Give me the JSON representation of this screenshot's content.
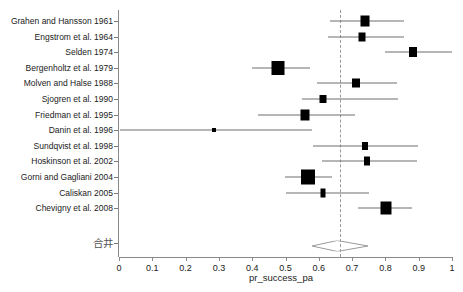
{
  "chart_data": {
    "type": "forest",
    "title": "",
    "xlabel": "pr_success_pa",
    "ylabel": "",
    "xlim": [
      0,
      1
    ],
    "xticks": [
      "0",
      "0.1",
      "0.2",
      "0.3",
      "0.4",
      "0.5",
      "0.6",
      "0.7",
      "0.8",
      "0.9",
      "1"
    ],
    "xtick_values": [
      0,
      0.1,
      0.2,
      0.3,
      0.4,
      0.5,
      0.6,
      0.7,
      0.8,
      0.9,
      1
    ],
    "grid": false,
    "legend": "none",
    "reference_line": 0.665,
    "summary_label": "合井",
    "summary": {
      "estimate": 0.665,
      "ci_low": 0.589,
      "ci_high": 0.757
    },
    "categories": [
      "Grahen and Hansson 1961",
      "Engstrom et al. 1964",
      "Selden 1974",
      "Bergenholtz et al. 1979",
      "Molven and Halse 1988",
      "Sjogren et al. 1990",
      "Friedman et al. 1995",
      "Danin et al. 1996",
      "Sundqvist et al. 1998",
      "Hoskinson et al. 2002",
      "Gorni and Gagliani 2004",
      "Caliskan 2005",
      "Chevigny et al. 2008"
    ],
    "studies": [
      {
        "label": "Grahen and Hansson 1961",
        "estimate": 0.739,
        "ci_low": 0.634,
        "ci_high": 0.856,
        "marker": "box",
        "box_w": 9,
        "box_h": 11
      },
      {
        "label": "Engstrom et al. 1964",
        "estimate": 0.73,
        "ci_low": 0.628,
        "ci_high": 0.856,
        "marker": "box",
        "box_w": 7,
        "box_h": 9
      },
      {
        "label": "Selden 1974",
        "estimate": 0.883,
        "ci_low": 0.799,
        "ci_high": 1.0,
        "marker": "box",
        "box_w": 8,
        "box_h": 10
      },
      {
        "label": "Bergenholtz et al. 1979",
        "estimate": 0.478,
        "ci_low": 0.4,
        "ci_high": 0.574,
        "marker": "box",
        "box_w": 13,
        "box_h": 14
      },
      {
        "label": "Molven and Halse 1988",
        "estimate": 0.712,
        "ci_low": 0.595,
        "ci_high": 0.835,
        "marker": "box",
        "box_w": 8,
        "box_h": 9
      },
      {
        "label": "Sjogren et al. 1990",
        "estimate": 0.613,
        "ci_low": 0.55,
        "ci_high": 0.838,
        "marker": "box",
        "box_w": 7,
        "box_h": 8
      },
      {
        "label": "Friedman et al. 1995",
        "estimate": 0.559,
        "ci_low": 0.417,
        "ci_high": 0.709,
        "marker": "box",
        "box_w": 9,
        "box_h": 11
      },
      {
        "label": "Danin et al. 1996",
        "estimate": 0.286,
        "ci_low": 0.003,
        "ci_high": 0.58,
        "marker": "dot",
        "box_w": 4,
        "box_h": 4
      },
      {
        "label": "Sundqvist et al. 1998",
        "estimate": 0.739,
        "ci_low": 0.583,
        "ci_high": 0.898,
        "marker": "box",
        "box_w": 6,
        "box_h": 8
      },
      {
        "label": "Hoskinson et al. 2002",
        "estimate": 0.745,
        "ci_low": 0.61,
        "ci_high": 0.895,
        "marker": "box",
        "box_w": 6,
        "box_h": 9
      },
      {
        "label": "Gorni and Gagliani 2004",
        "estimate": 0.568,
        "ci_low": 0.498,
        "ci_high": 0.64,
        "marker": "box",
        "box_w": 14,
        "box_h": 15
      },
      {
        "label": "Caliskan 2005",
        "estimate": 0.613,
        "ci_low": 0.502,
        "ci_high": 0.75,
        "marker": "box",
        "box_w": 5,
        "box_h": 9
      },
      {
        "label": "Chevigny et al. 2008",
        "estimate": 0.802,
        "ci_low": 0.718,
        "ci_high": 0.88,
        "marker": "box",
        "box_w": 11,
        "box_h": 13
      }
    ]
  }
}
